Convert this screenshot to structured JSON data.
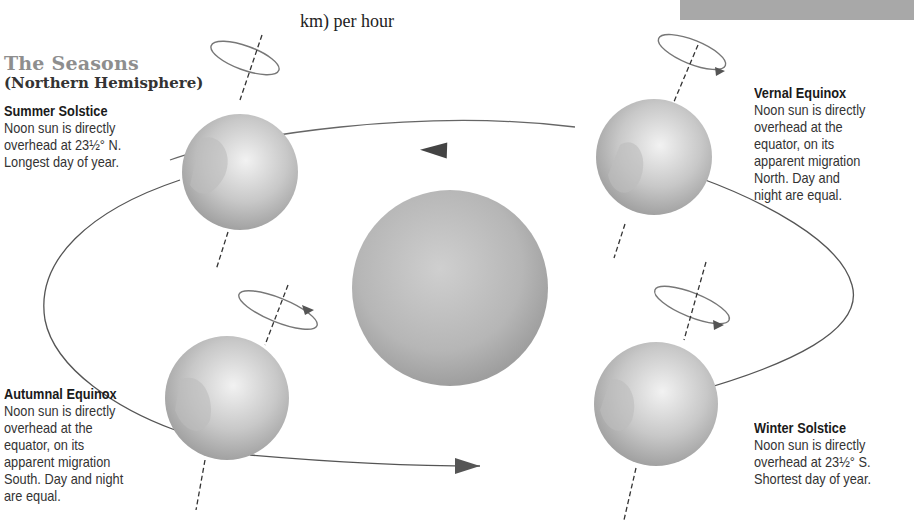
{
  "header": {
    "top_text_line1": "miles (107,000",
    "top_text_line2": "km) per hour",
    "title": "The Seasons",
    "subtitle": "(Northern Hemisphere)"
  },
  "colors": {
    "title_gray": "#8e8e8e",
    "banner_gray": "#a8a8a8",
    "sun_gray": "#b5b5b5",
    "orbit_line": "#555555"
  },
  "positions": [
    {
      "id": "summer",
      "heading": "Summer Solstice",
      "lines": [
        "Noon sun is directly",
        "overhead at 23½° N.",
        "Longest day of year."
      ]
    },
    {
      "id": "vernal",
      "heading": "Vernal Equinox",
      "lines": [
        "Noon sun is directly",
        "overhead at the",
        "equator, on its",
        "apparent migration",
        "North. Day and",
        "night are equal."
      ]
    },
    {
      "id": "autumnal",
      "heading": "Autumnal Equinox",
      "lines": [
        "Noon sun is directly",
        "overhead at the",
        "equator, on its",
        "apparent migration",
        "South. Day and night",
        "are equal."
      ]
    },
    {
      "id": "winter",
      "heading": "Winter Solstice",
      "lines": [
        "Noon sun is directly",
        "overhead at 23½° S.",
        "Shortest day of year."
      ]
    }
  ],
  "icons": {
    "sun": "sun-sphere",
    "earth": "earth-globe",
    "orbit_arrow": "orbit-direction-arrow",
    "rotation_arrow": "rotation-arrow"
  }
}
